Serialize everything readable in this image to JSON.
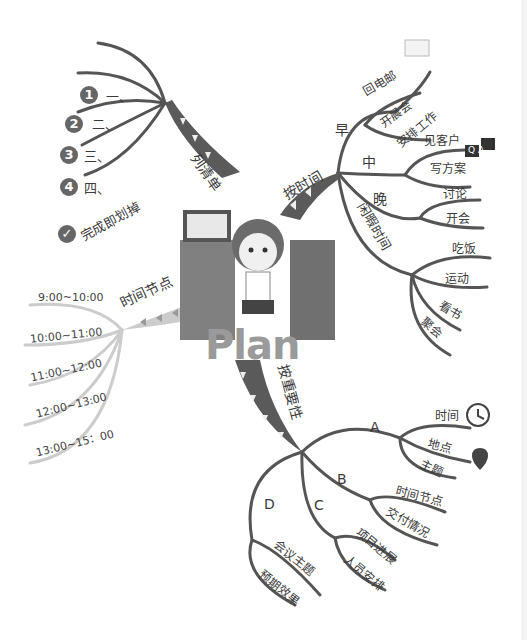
{
  "title": "Plan",
  "center": {
    "label": "Plan",
    "figure": "office worker at desk"
  },
  "branches": {
    "list": {
      "label": "列清单",
      "items": [
        {
          "num": "1",
          "label": "一、"
        },
        {
          "num": "2",
          "label": "二、"
        },
        {
          "num": "3",
          "label": "三、"
        },
        {
          "num": "4",
          "label": "四、"
        },
        {
          "icon": "check-icon",
          "label": "完成即划掉"
        }
      ]
    },
    "by_time": {
      "label": "按时间",
      "groups": [
        {
          "label": "早",
          "items": [
            "回电邮",
            "开晨会",
            "安排工作"
          ]
        },
        {
          "label": "中",
          "items": [
            "见客户",
            "写方案"
          ]
        },
        {
          "label": "晚",
          "items": [
            "讨论",
            "开会"
          ]
        },
        {
          "label": "闲暇时间",
          "items": [
            "吃饭",
            "运动",
            "看书",
            "聚会"
          ]
        }
      ],
      "icons": {
        "qa": [
          "Q",
          "A"
        ]
      }
    },
    "time_nodes": {
      "label": "时间节点",
      "items": [
        "9:00~10:00",
        "10:00~11:00",
        "11:00~12:00",
        "12:00~13:00",
        "13:00~15：00"
      ]
    },
    "by_importance": {
      "label": "按重要性",
      "groups": [
        {
          "label": "A",
          "items": [
            "时间",
            "地点",
            "主题"
          ]
        },
        {
          "label": "B",
          "items": [
            "时间节点",
            "交付情况"
          ]
        },
        {
          "label": "C",
          "items": [
            "项目进展",
            "人员安排"
          ]
        },
        {
          "label": "D",
          "items": [
            "会议主题",
            "预期效果"
          ]
        }
      ]
    }
  },
  "colors": {
    "branch": "#555555",
    "light_branch": "#c8c8c8",
    "text": "#3a3a3a",
    "ribbon": "#5a5a5a",
    "desk": "#808080"
  }
}
